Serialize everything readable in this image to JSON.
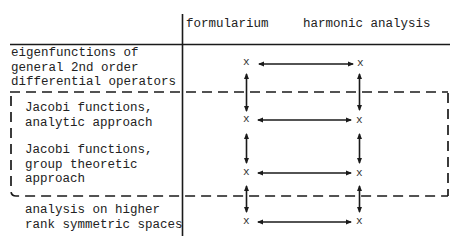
{
  "header": {
    "col1": "formularium",
    "col2": "harmonic analysis"
  },
  "rows": [
    {
      "label_lines": [
        "eigenfunctions of",
        "general 2nd order",
        "differential operators"
      ]
    },
    {
      "label_lines": [
        "Jacobi functions,",
        "analytic approach"
      ]
    },
    {
      "label_lines": [
        "Jacobi functions,",
        "group theoretic",
        "approach"
      ]
    },
    {
      "label_lines": [
        "analysis on higher",
        "rank symmetric spaces"
      ]
    }
  ],
  "marker": "x",
  "dashed_box": {
    "encloses_rows": [
      "Jacobi functions, analytic approach",
      "Jacobi functions, group theoretic approach"
    ]
  },
  "arrows": {
    "horizontal": "double-headed between formularium and harmonic analysis for every row",
    "vertical": "double-headed between consecutive rows in each column"
  },
  "colors": {
    "ink": "#1a1a1a",
    "background": "#ffffff"
  }
}
